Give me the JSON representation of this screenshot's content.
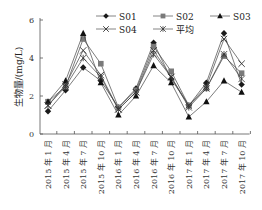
{
  "chart_data": {
    "type": "line",
    "title": "",
    "xlabel": "",
    "ylabel": "生物量/(mg/L)",
    "ylim": [
      0,
      6
    ],
    "yticks": [
      0,
      2,
      4,
      6
    ],
    "grid": false,
    "legend_position": "top-right",
    "categories": [
      "2015 年 1 月",
      "2015 年 4 月",
      "2015 年 7 月",
      "2015 年 10 月",
      "2016 年 1 月",
      "2016 年 4 月",
      "2016 年 7 月",
      "2016 年 10 月",
      "2017 年 1 月",
      "2017 年 4 月",
      "2017 年 7 月",
      "2017 年 10 月"
    ],
    "series": [
      {
        "name": "S01",
        "marker": "diamond-filled",
        "color": "#1a1a1a",
        "values": [
          1.2,
          2.3,
          3.5,
          2.8,
          1.4,
          2.4,
          4.8,
          2.9,
          1.5,
          2.7,
          5.3,
          2.6
        ]
      },
      {
        "name": "S02",
        "marker": "square-filled",
        "color": "#7a7a7a",
        "values": [
          1.7,
          2.5,
          5.0,
          3.7,
          1.4,
          2.3,
          4.6,
          3.3,
          1.5,
          2.4,
          4.1,
          3.2
        ]
      },
      {
        "name": "S03",
        "marker": "triangle-filled",
        "color": "#111111",
        "values": [
          1.7,
          2.8,
          5.3,
          2.7,
          1.0,
          2.0,
          3.6,
          2.7,
          0.9,
          1.7,
          2.8,
          2.2
        ]
      },
      {
        "name": "S04",
        "marker": "x",
        "color": "#333333",
        "values": [
          1.5,
          2.6,
          4.4,
          3.1,
          1.3,
          2.2,
          4.4,
          3.0,
          1.5,
          2.5,
          5.0,
          3.7
        ]
      },
      {
        "name": "平均",
        "marker": "asterisk",
        "color": "#333333",
        "values": [
          1.5,
          2.5,
          4.0,
          3.0,
          1.3,
          2.2,
          4.2,
          3.0,
          1.4,
          2.4,
          4.2,
          2.9
        ]
      }
    ]
  }
}
